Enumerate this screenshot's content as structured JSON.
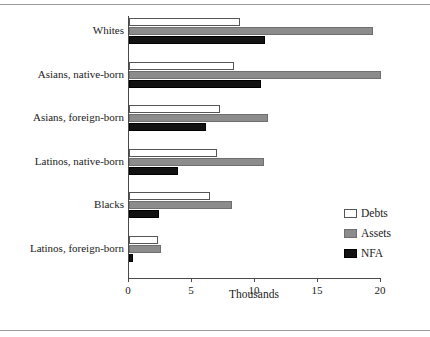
{
  "chart_data": {
    "type": "bar",
    "orientation": "horizontal",
    "title": "",
    "subtitle": "",
    "xlabel": "Thousands",
    "ylabel": "",
    "xlim": [
      0,
      20
    ],
    "xticks": [
      0,
      5,
      10,
      15,
      20
    ],
    "xtick_labels": [
      "0",
      "5",
      "10",
      "15",
      "20"
    ],
    "grid": false,
    "legend_position": "right-lower",
    "categories": [
      "Whites",
      "Asians, native-born",
      "Asians, foreign-born",
      "Latinos, native-born",
      "Blacks",
      "Latinos, foreign-born"
    ],
    "series": [
      {
        "name": "Debts",
        "color": "#ffffff",
        "values": [
          8.8,
          8.3,
          7.2,
          7.0,
          6.4,
          2.3
        ]
      },
      {
        "name": "Assets",
        "color": "#8c8c8c",
        "values": [
          19.4,
          20.0,
          11.0,
          10.7,
          8.2,
          2.5
        ]
      },
      {
        "name": "NFA",
        "color": "#121212",
        "values": [
          10.8,
          10.5,
          6.1,
          3.9,
          2.4,
          0.3
        ]
      }
    ]
  },
  "axis": {
    "x_title": "Thousands"
  },
  "legend": {
    "items": [
      {
        "label": "Debts"
      },
      {
        "label": "Assets"
      },
      {
        "label": "NFA"
      }
    ]
  }
}
